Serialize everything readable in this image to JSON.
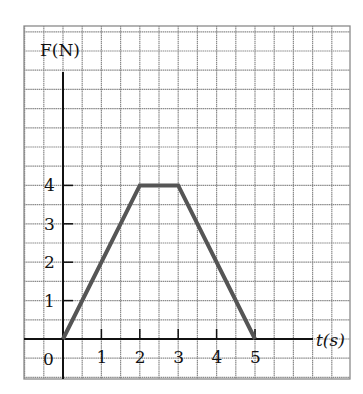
{
  "chart_data": {
    "type": "line",
    "title": "",
    "xlabel": "t(s)",
    "ylabel": "F(N)",
    "x": [
      0,
      2,
      3,
      5
    ],
    "series": [
      {
        "name": "F",
        "values": [
          0,
          4,
          4,
          0
        ]
      }
    ],
    "xticks": [
      "0",
      "1",
      "2",
      "3",
      "4",
      "5"
    ],
    "yticks": [
      "1",
      "2",
      "3",
      "4"
    ],
    "xlim": [
      -1,
      7.5
    ],
    "ylim": [
      -1,
      7
    ],
    "grid": true,
    "legend": "none",
    "colors": {
      "line": "#555555",
      "grid": "#8a8a8a",
      "axis": "#111111"
    }
  },
  "labels": {
    "y_axis": "F(N)",
    "x_axis": "t(s)",
    "origin": "0"
  }
}
